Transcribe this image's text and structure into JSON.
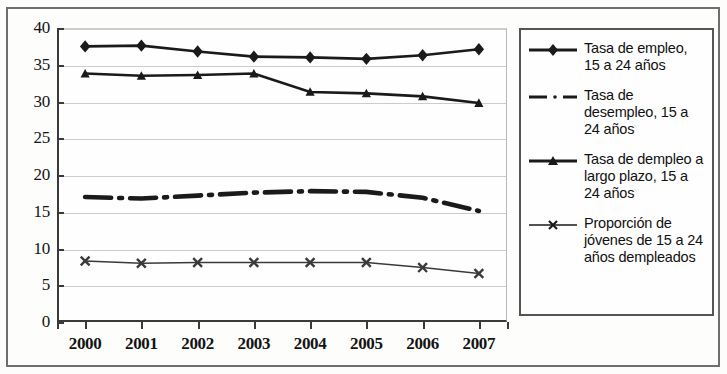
{
  "chart_data": {
    "type": "line",
    "title": "",
    "xlabel": "",
    "ylabel": "",
    "categories": [
      "2000",
      "2001",
      "2002",
      "2003",
      "2004",
      "2005",
      "2006",
      "2007"
    ],
    "x": [
      2000,
      2001,
      2002,
      2003,
      2004,
      2005,
      2006,
      2007
    ],
    "ylim": [
      0,
      40
    ],
    "yticks": [
      0,
      5,
      10,
      15,
      20,
      25,
      30,
      35,
      40
    ],
    "grid": true,
    "legend_position": "right",
    "series": [
      {
        "name": "Tasa de empleo, 15 a 24 años",
        "marker": "diamond",
        "line_style": "solid",
        "color": "#1a1a1a",
        "values": [
          37.5,
          37.6,
          36.8,
          36.1,
          36.0,
          35.8,
          36.3,
          37.1
        ]
      },
      {
        "name": "Tasa de desempleo, 15 a 24 años",
        "marker": "none",
        "line_style": "dash-dot",
        "color": "#1a1a1a",
        "values": [
          17.0,
          16.8,
          17.2,
          17.6,
          17.8,
          17.7,
          16.9,
          15.1
        ]
      },
      {
        "name": "Tasa de dempleo a largo plazo, 15 a 24 años",
        "marker": "triangle",
        "line_style": "solid",
        "color": "#1a1a1a",
        "values": [
          33.8,
          33.5,
          33.6,
          33.8,
          31.3,
          31.1,
          30.7,
          29.8
        ]
      },
      {
        "name": "Proporción de jóvenes de 15 a 24 años dempleados",
        "marker": "x",
        "line_style": "solid",
        "color": "#3a3a3a",
        "values": [
          8.3,
          8.0,
          8.1,
          8.1,
          8.1,
          8.1,
          7.4,
          6.6
        ]
      }
    ]
  },
  "axes": {
    "y_tick_labels": [
      "40",
      "35",
      "30",
      "25",
      "20",
      "15",
      "10",
      "5",
      "0"
    ],
    "x_tick_labels": [
      "2000",
      "2001",
      "2002",
      "2003",
      "2004",
      "2005",
      "2006",
      "2007"
    ]
  },
  "legend": {
    "items": [
      {
        "label": "Tasa de empleo, 15 a 24 años",
        "marker": "diamond-line-marker"
      },
      {
        "label": "Tasa de desempleo, 15 a 24 años",
        "marker": "dash-dot-line-marker"
      },
      {
        "label": "Tasa de dempleo a largo plazo, 15 a 24 años",
        "marker": "triangle-line-marker"
      },
      {
        "label": "Proporción de jóvenes de 15 a 24 años dempleados",
        "marker": "x-line-marker"
      }
    ]
  }
}
